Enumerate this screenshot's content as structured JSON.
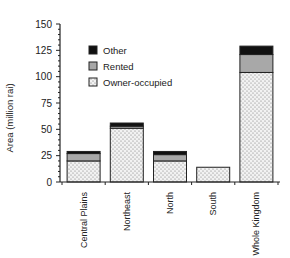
{
  "chart_data": {
    "type": "bar",
    "stacked": true,
    "title": "",
    "xlabel": "",
    "ylabel": "Area (million rai)",
    "ylim": [
      0,
      150
    ],
    "yticks": [
      0,
      25,
      50,
      75,
      100,
      125,
      150
    ],
    "grid": false,
    "legend_position": "upper-left inside plot",
    "categories": [
      "Central Plains",
      "Northeast",
      "North",
      "South",
      "Whole Kingdom"
    ],
    "series": [
      {
        "name": "Owner-occupied",
        "pattern": "dotted",
        "color": "#e6e6e6",
        "values": [
          20,
          51,
          20,
          14,
          104
        ]
      },
      {
        "name": "Rented",
        "pattern": "solid",
        "color": "#a8a8a8",
        "values": [
          7,
          2,
          6,
          0,
          17
        ]
      },
      {
        "name": "Other",
        "pattern": "solid",
        "color": "#111111",
        "values": [
          2,
          3,
          3,
          0,
          8
        ]
      }
    ],
    "legend": [
      "Other",
      "Rented",
      "Owner-occupied"
    ]
  }
}
